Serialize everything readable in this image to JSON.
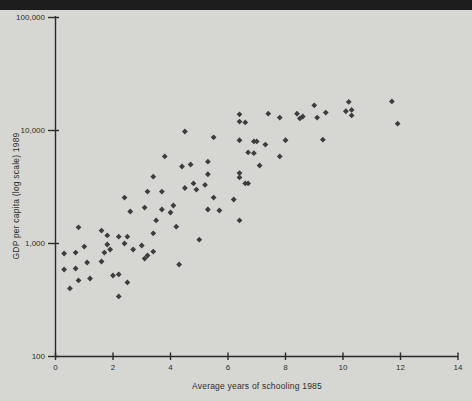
{
  "chart_data": {
    "type": "scatter",
    "title": "",
    "xlabel": "Average years of schooling 1985",
    "ylabel": "GDP per capita (log scale) 1989",
    "x_ticks": [
      0,
      2,
      4,
      6,
      8,
      10,
      12,
      14
    ],
    "xlim": [
      0,
      14
    ],
    "y_scale": "log",
    "ylim": [
      100,
      100000
    ],
    "y_ticks": [
      {
        "value": 100,
        "label": "100"
      },
      {
        "value": 1000,
        "label": "1,000"
      },
      {
        "value": 10000,
        "label": "10,000"
      },
      {
        "value": 100000,
        "label": "100,000"
      }
    ],
    "grid": false,
    "legend": "none",
    "marker": "diamond",
    "colors": {
      "marker": "#3d3d40",
      "axis": "#2b2b2b",
      "text": "#2e2e2e",
      "background": "#d6d7d3",
      "header_bar": "#1d1d1d"
    },
    "points": [
      [
        11.7,
        18100
      ],
      [
        10.2,
        17900
      ],
      [
        10.1,
        14800
      ],
      [
        10.3,
        15200
      ],
      [
        10.3,
        13600
      ],
      [
        9.0,
        16700
      ],
      [
        9.1,
        13000
      ],
      [
        9.4,
        14400
      ],
      [
        11.9,
        11500
      ],
      [
        9.3,
        8300
      ],
      [
        8.4,
        14100
      ],
      [
        8.5,
        12800
      ],
      [
        8.6,
        13300
      ],
      [
        6.4,
        13900
      ],
      [
        6.4,
        12000
      ],
      [
        6.6,
        11800
      ],
      [
        7.4,
        14100
      ],
      [
        7.8,
        13000
      ],
      [
        4.5,
        9800
      ],
      [
        5.5,
        8700
      ],
      [
        6.4,
        8200
      ],
      [
        6.9,
        8000
      ],
      [
        7.0,
        8000
      ],
      [
        7.3,
        7500
      ],
      [
        8.0,
        8200
      ],
      [
        6.7,
        6400
      ],
      [
        6.9,
        6300
      ],
      [
        3.8,
        5900
      ],
      [
        4.4,
        4800
      ],
      [
        4.7,
        5000
      ],
      [
        3.4,
        3900
      ],
      [
        7.8,
        5900
      ],
      [
        7.1,
        4900
      ],
      [
        5.3,
        5300
      ],
      [
        5.3,
        4100
      ],
      [
        6.4,
        4200
      ],
      [
        6.4,
        3840
      ],
      [
        6.6,
        3400
      ],
      [
        6.7,
        3400
      ],
      [
        4.5,
        3100
      ],
      [
        4.8,
        3400
      ],
      [
        4.9,
        3000
      ],
      [
        5.2,
        3300
      ],
      [
        5.5,
        2550
      ],
      [
        6.2,
        2450
      ],
      [
        5.3,
        2000
      ],
      [
        5.7,
        1960
      ],
      [
        6.4,
        1600
      ],
      [
        5.0,
        1080
      ],
      [
        2.4,
        2550
      ],
      [
        3.2,
        2880
      ],
      [
        3.7,
        2880
      ],
      [
        2.6,
        1920
      ],
      [
        3.1,
        2080
      ],
      [
        3.7,
        2000
      ],
      [
        4.1,
        2170
      ],
      [
        4.0,
        1880
      ],
      [
        3.5,
        1600
      ],
      [
        4.2,
        1410
      ],
      [
        0.8,
        1390
      ],
      [
        1.6,
        1300
      ],
      [
        1.8,
        1180
      ],
      [
        2.2,
        1150
      ],
      [
        2.5,
        1150
      ],
      [
        3.4,
        1230
      ],
      [
        1.0,
        940
      ],
      [
        1.8,
        980
      ],
      [
        2.4,
        1000
      ],
      [
        3.0,
        960
      ],
      [
        0.3,
        816
      ],
      [
        0.7,
        832
      ],
      [
        1.7,
        832
      ],
      [
        1.9,
        885
      ],
      [
        2.7,
        885
      ],
      [
        3.2,
        783
      ],
      [
        3.4,
        849
      ],
      [
        3.1,
        736
      ],
      [
        1.1,
        679
      ],
      [
        1.6,
        693
      ],
      [
        4.3,
        652
      ],
      [
        0.3,
        589
      ],
      [
        0.7,
        601
      ],
      [
        1.2,
        490
      ],
      [
        2.0,
        521
      ],
      [
        2.2,
        532
      ],
      [
        2.5,
        452
      ],
      [
        0.5,
        400
      ],
      [
        0.8,
        471
      ],
      [
        2.2,
        340
      ]
    ]
  }
}
